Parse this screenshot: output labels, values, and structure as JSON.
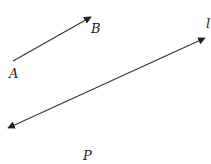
{
  "diagram": {
    "labels": {
      "a": "A",
      "b": "B",
      "line": "l",
      "p": "P"
    },
    "stroke_color": "#333333",
    "text_color": "#222222"
  }
}
